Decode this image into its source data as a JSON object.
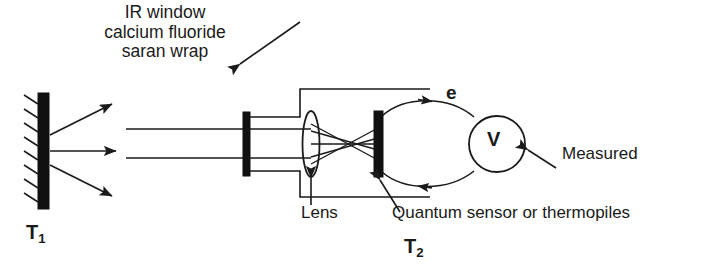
{
  "diagram": {
    "title_block": {
      "lines": [
        "IR window",
        "calcium fluoride",
        "saran wrap"
      ],
      "text": "IR window\ncalcium fluoride\nsaran wrap"
    },
    "labels": {
      "source_temperature": "T",
      "source_temperature_sub": "1",
      "sensor_temperature": "T",
      "sensor_temperature_sub": "2",
      "electron_flow": "e",
      "voltmeter": "V",
      "lens": "Lens",
      "sensor": "Quantum sensor or thermopiles",
      "measured": "Measured"
    },
    "colors": {
      "background": "#ffffff",
      "ink": "#1a1a1a",
      "fill_black": "#111111"
    },
    "components": [
      {
        "name": "blackbody-source-wall",
        "label": "T1",
        "shape": "hatched-vertical-bar"
      },
      {
        "name": "ir-window",
        "label": "IR window calcium fluoride saran wrap",
        "shape": "thick-vertical-bar"
      },
      {
        "name": "lens",
        "label": "Lens",
        "shape": "ellipse"
      },
      {
        "name": "detector",
        "label": "Quantum sensor or thermopiles",
        "shape": "thick-vertical-bar"
      },
      {
        "name": "voltmeter",
        "label": "V",
        "shape": "circle"
      }
    ],
    "radiation_rays": 3,
    "beam_lines": 2,
    "circuit": {
      "top_arrow_direction": "right",
      "bottom_arrow_direction": "left",
      "flow_label": "e"
    }
  }
}
